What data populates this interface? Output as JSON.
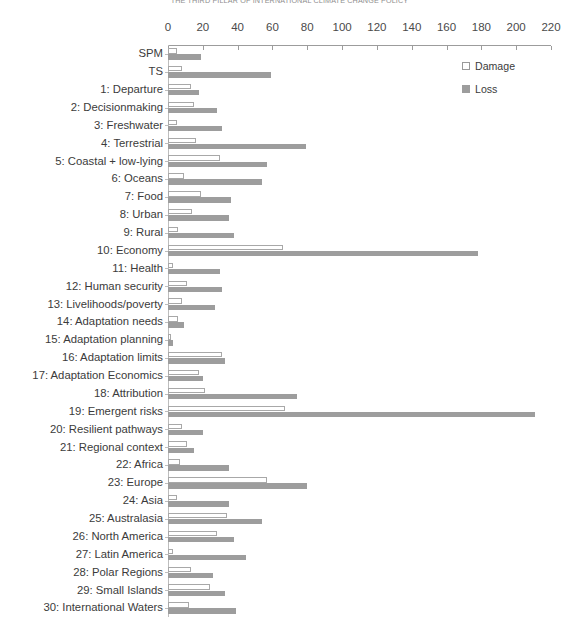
{
  "chart_data": {
    "type": "bar",
    "orientation": "horizontal",
    "title": "THE THIRD PILLAR OF INTERNATIONAL CLIMATE CHANGE POLICY",
    "xlabel": "",
    "ylabel": "",
    "xlim": [
      0,
      220
    ],
    "xticks": [
      0,
      20,
      40,
      60,
      80,
      100,
      120,
      140,
      160,
      180,
      200,
      220
    ],
    "grid": false,
    "legend_position": "top-right",
    "legend": [
      "Damage",
      "Loss"
    ],
    "colors": {
      "damage": "#ffffff",
      "damage_border": "#a8a8a8",
      "loss": "#9d9d9d",
      "axis": "#9c9c9c",
      "text": "#3b3b3b"
    },
    "categories": [
      "SPM",
      "TS",
      "1: Departure",
      "2: Decisionmaking",
      "3: Freshwater",
      "4: Terrestrial",
      "5: Coastal + low-lying",
      "6: Oceans",
      "7: Food",
      "8: Urban",
      "9: Rural",
      "10: Economy",
      "11: Health",
      "12: Human security",
      "13: Livelihoods/poverty",
      "14: Adaptation needs",
      "15: Adaptation planning",
      "16: Adaptation limits",
      "17: Adaptation Economics",
      "18: Attribution",
      "19: Emergent risks",
      "20: Resilient pathways",
      "21: Regional context",
      "22: Africa",
      "23: Europe",
      "24: Asia",
      "25: Australasia",
      "26: North America",
      "27: Latin America",
      "28: Polar Regions",
      "29: Small Islands",
      "30:  International Waters"
    ],
    "series": [
      {
        "name": "Damage",
        "values": [
          5,
          8,
          13,
          15,
          5,
          16,
          30,
          9,
          19,
          14,
          6,
          66,
          3,
          11,
          8,
          6,
          2,
          31,
          18,
          21,
          67,
          8,
          11,
          7,
          57,
          5,
          34,
          28,
          3,
          13,
          24,
          12
        ]
      },
      {
        "name": "Loss",
        "values": [
          19,
          59,
          18,
          28,
          31,
          79,
          57,
          54,
          36,
          35,
          38,
          178,
          30,
          31,
          27,
          9,
          3,
          33,
          20,
          74,
          211,
          20,
          15,
          35,
          80,
          35,
          54,
          38,
          45,
          26,
          33,
          39
        ]
      }
    ]
  }
}
